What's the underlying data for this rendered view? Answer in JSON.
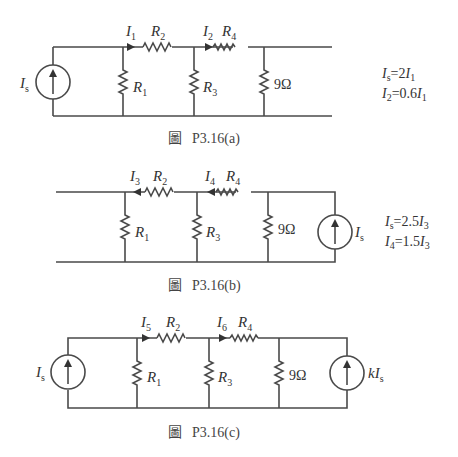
{
  "figures": [
    {
      "id": "a",
      "caption_prefix": "圖",
      "caption": "P3.16(a)",
      "source_left": {
        "label": "I",
        "sub": "s"
      },
      "currents": [
        {
          "label": "I",
          "sub": "1",
          "direction": "right"
        },
        {
          "label": "I",
          "sub": "2",
          "direction": "right"
        }
      ],
      "resistors": {
        "r1": {
          "label": "R",
          "sub": "1"
        },
        "r2": {
          "label": "R",
          "sub": "2"
        },
        "r3": {
          "label": "R",
          "sub": "3"
        },
        "r4": {
          "label": "R",
          "sub": "4"
        },
        "load": "9Ω"
      },
      "equations": [
        {
          "lhs": "I",
          "lhs_sub": "s",
          "rhs_pre": "=2",
          "rhs": "I",
          "rhs_sub": "1"
        },
        {
          "lhs": "I",
          "lhs_sub": "2",
          "rhs_pre": "=0.6",
          "rhs": "I",
          "rhs_sub": "1"
        }
      ]
    },
    {
      "id": "b",
      "caption_prefix": "圖",
      "caption": "P3.16(b)",
      "source_right": {
        "label": "I",
        "sub": "s"
      },
      "currents": [
        {
          "label": "I",
          "sub": "3",
          "direction": "left"
        },
        {
          "label": "I",
          "sub": "4",
          "direction": "left"
        }
      ],
      "resistors": {
        "r1": {
          "label": "R",
          "sub": "1"
        },
        "r2": {
          "label": "R",
          "sub": "2"
        },
        "r3": {
          "label": "R",
          "sub": "3"
        },
        "r4": {
          "label": "R",
          "sub": "4"
        },
        "load": "9Ω"
      },
      "equations": [
        {
          "lhs": "I",
          "lhs_sub": "s",
          "rhs_pre": "=2.5",
          "rhs": "I",
          "rhs_sub": "3"
        },
        {
          "lhs": "I",
          "lhs_sub": "4",
          "rhs_pre": "=1.5",
          "rhs": "I",
          "rhs_sub": "3"
        }
      ]
    },
    {
      "id": "c",
      "caption_prefix": "圖",
      "caption": "P3.16(c)",
      "source_left": {
        "label": "I",
        "sub": "s"
      },
      "source_right": {
        "label": "kI",
        "sub": "s"
      },
      "currents": [
        {
          "label": "I",
          "sub": "5",
          "direction": "right"
        },
        {
          "label": "I",
          "sub": "6",
          "direction": "right"
        }
      ],
      "resistors": {
        "r1": {
          "label": "R",
          "sub": "1"
        },
        "r2": {
          "label": "R",
          "sub": "2"
        },
        "r3": {
          "label": "R",
          "sub": "3"
        },
        "r4": {
          "label": "R",
          "sub": "4"
        },
        "load": "9Ω"
      }
    }
  ]
}
